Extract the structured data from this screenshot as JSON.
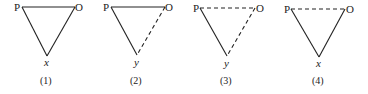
{
  "figure": {
    "panels": [
      {
        "caption": "(1)",
        "vertices": {
          "left": "P",
          "right": "O",
          "bottom": "x"
        },
        "edges": {
          "P-O": "solid",
          "P-bottom": "solid",
          "O-bottom": "solid"
        }
      },
      {
        "caption": "(2)",
        "vertices": {
          "left": "P",
          "right": "O",
          "bottom": "y"
        },
        "edges": {
          "P-O": "solid",
          "P-bottom": "solid",
          "O-bottom": "dashed"
        }
      },
      {
        "caption": "(3)",
        "vertices": {
          "left": "P",
          "right": "O",
          "bottom": "y"
        },
        "edges": {
          "P-O": "dashed",
          "P-bottom": "solid",
          "O-bottom": "dashed"
        }
      },
      {
        "caption": "(4)",
        "vertices": {
          "left": "P",
          "right": "O",
          "bottom": "x"
        },
        "edges": {
          "P-O": "dashed",
          "P-bottom": "solid",
          "O-bottom": "solid"
        }
      }
    ]
  }
}
